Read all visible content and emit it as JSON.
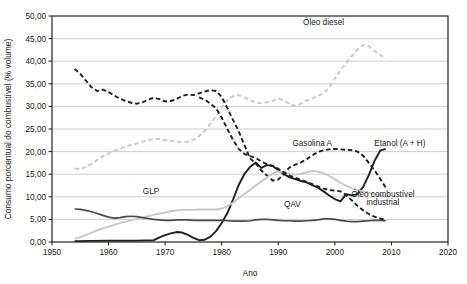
{
  "chart_data": {
    "type": "line",
    "title": "",
    "xlabel": "Ano",
    "ylabel": "Consumo porcentual do  combustível (% volume)",
    "xlim": [
      1950,
      2020
    ],
    "ylim": [
      0,
      50
    ],
    "xticks": [
      "1950",
      "1960",
      "1970",
      "1980",
      "1990",
      "2000",
      "2010",
      "2020"
    ],
    "xtick_values": [
      1950,
      1960,
      1970,
      1980,
      1990,
      2000,
      2010,
      2020
    ],
    "yticks": [
      "0,00",
      "5,00",
      "10,00",
      "15,00",
      "20,00",
      "25,00",
      "30,00",
      "35,00",
      "40,00",
      "45,00",
      "50,00"
    ],
    "ytick_values": [
      0,
      5,
      10,
      15,
      20,
      25,
      30,
      35,
      40,
      45,
      50
    ],
    "grid": true,
    "legend_position": "inline-annotations",
    "annotations": [
      {
        "text": "Óleo diesel",
        "x": 1998,
        "y": 48.0,
        "series": "Óleo diesel"
      },
      {
        "text": "Gasolina A",
        "x": 1996,
        "y": 21.2,
        "series": "Gasolina A"
      },
      {
        "text": "Etanol (A + H)",
        "x": 2011.5,
        "y": 21.2,
        "series": "Etanol (A + H)"
      },
      {
        "text": "GLP",
        "x": 1967.5,
        "y": 10.6,
        "series": "GLP"
      },
      {
        "text": "QAV",
        "x": 1992.5,
        "y": 7.8,
        "series": "QAV"
      },
      {
        "text": "Óleo combustível",
        "x": 2008.5,
        "y": 9.9,
        "series": "Óleo combustível industrial"
      },
      {
        "text": "industrial",
        "x": 2008.5,
        "y": 8.2,
        "series": "Óleo combustível industrial"
      }
    ],
    "series": [
      {
        "name": "Óleo diesel",
        "color": "#c8c8c8",
        "style": "dashed",
        "width": 1.9,
        "x": [
          1954,
          1955,
          1956,
          1957,
          1958,
          1959,
          1960,
          1961,
          1962,
          1963,
          1964,
          1965,
          1966,
          1967,
          1968,
          1969,
          1970,
          1971,
          1972,
          1973,
          1974,
          1975,
          1976,
          1977,
          1978,
          1979,
          1980,
          1981,
          1982,
          1983,
          1984,
          1985,
          1986,
          1987,
          1988,
          1989,
          1990,
          1991,
          1992,
          1993,
          1994,
          1995,
          1996,
          1997,
          1998,
          1999,
          2000,
          2001,
          2002,
          2003,
          2004,
          2005,
          2006,
          2007,
          2008,
          2009
        ],
        "values": [
          16.3,
          16.1,
          16.6,
          17.3,
          18.2,
          19.0,
          19.6,
          20.2,
          20.6,
          21.1,
          21.5,
          21.8,
          22.2,
          22.5,
          22.8,
          22.8,
          22.5,
          22.4,
          22.2,
          22.1,
          22.2,
          22.6,
          23.4,
          24.6,
          26.1,
          27.8,
          29.6,
          31.4,
          32.3,
          32.5,
          32.0,
          31.4,
          30.9,
          30.7,
          30.9,
          31.2,
          31.7,
          31.4,
          30.5,
          30.1,
          30.6,
          31.3,
          31.8,
          32.3,
          32.9,
          34.2,
          36.2,
          38.1,
          39.6,
          41.1,
          42.6,
          43.6,
          43.3,
          42.3,
          41.4,
          40.6
        ]
      },
      {
        "name": "Gasolina A",
        "color": "#1f1f1f",
        "style": "dashed",
        "width": 1.9,
        "x": [
          1954,
          1955,
          1956,
          1957,
          1958,
          1959,
          1960,
          1961,
          1962,
          1963,
          1964,
          1965,
          1966,
          1967,
          1968,
          1969,
          1970,
          1971,
          1972,
          1973,
          1974,
          1975,
          1976,
          1977,
          1978,
          1979,
          1980,
          1981,
          1982,
          1983,
          1984,
          1985,
          1986,
          1987,
          1988,
          1989,
          1990,
          1991,
          1992,
          1993,
          1994,
          1995,
          1996,
          1997,
          1998,
          1999,
          2000,
          2001,
          2002,
          2003,
          2004,
          2005,
          2006,
          2007,
          2008,
          2009
        ],
        "values": [
          38.3,
          37.2,
          35.7,
          34.2,
          33.4,
          33.7,
          33.2,
          32.4,
          31.7,
          31.2,
          30.8,
          30.6,
          30.9,
          31.5,
          31.9,
          31.6,
          31.1,
          31.2,
          31.6,
          32.3,
          32.6,
          32.5,
          32.9,
          33.3,
          33.6,
          33.4,
          32.1,
          29.6,
          27.0,
          24.5,
          21.5,
          18.5,
          17.4,
          15.8,
          14.7,
          13.6,
          13.8,
          15.1,
          16.5,
          17.1,
          17.6,
          18.3,
          19.2,
          19.9,
          20.3,
          20.5,
          20.6,
          20.5,
          20.4,
          20.3,
          20.0,
          19.1,
          17.5,
          15.9,
          14.0,
          12.0
        ]
      },
      {
        "name": "Etanol (A + H)",
        "color": "#1f1f1f",
        "style": "solid",
        "width": 1.9,
        "x": [
          1954,
          1960,
          1965,
          1968,
          1969,
          1970,
          1971,
          1972,
          1973,
          1974,
          1975,
          1976,
          1977,
          1978,
          1979,
          1980,
          1981,
          1982,
          1983,
          1984,
          1985,
          1986,
          1987,
          1988,
          1989,
          1990,
          1991,
          1992,
          1993,
          1994,
          1995,
          1996,
          1997,
          1998,
          1999,
          2000,
          2001,
          2002,
          2003,
          2004,
          2005,
          2006,
          2007,
          2008,
          2009
        ],
        "values": [
          0.2,
          0.3,
          0.3,
          0.4,
          1.0,
          1.5,
          1.9,
          2.2,
          2.1,
          1.6,
          0.9,
          0.4,
          0.5,
          1.2,
          2.4,
          4.2,
          6.4,
          9.4,
          12.6,
          15.0,
          16.6,
          17.6,
          16.4,
          17.0,
          16.8,
          15.9,
          15.0,
          14.3,
          13.9,
          13.5,
          13.2,
          12.6,
          12.0,
          11.2,
          10.3,
          9.5,
          9.0,
          10.6,
          10.3,
          10.6,
          12.2,
          14.8,
          17.9,
          20.2,
          20.6
        ]
      },
      {
        "name": "GLP",
        "color": "#c8c8c8",
        "style": "solid",
        "width": 1.9,
        "x": [
          1954,
          1955,
          1956,
          1957,
          1958,
          1959,
          1960,
          1961,
          1962,
          1963,
          1964,
          1965,
          1966,
          1967,
          1968,
          1969,
          1970,
          1971,
          1972,
          1973,
          1974,
          1975,
          1976,
          1977,
          1978,
          1979,
          1980,
          1981,
          1982,
          1983,
          1984,
          1985,
          1986,
          1987,
          1988,
          1989,
          1990,
          1991,
          1992,
          1993,
          1994,
          1995,
          1996,
          1997,
          1998,
          1999,
          2000,
          2001,
          2002,
          2003,
          2004,
          2005,
          2006,
          2007,
          2008,
          2009
        ],
        "values": [
          0.7,
          1.1,
          1.6,
          2.1,
          2.6,
          3.0,
          3.4,
          3.8,
          4.2,
          4.5,
          4.8,
          5.1,
          5.4,
          5.7,
          6.0,
          6.3,
          6.5,
          6.8,
          7.0,
          7.1,
          7.1,
          7.1,
          7.2,
          7.2,
          7.2,
          7.2,
          7.4,
          7.9,
          8.7,
          9.7,
          10.6,
          11.5,
          12.5,
          13.4,
          14.3,
          15.1,
          15.6,
          15.4,
          15.0,
          14.9,
          15.1,
          15.4,
          15.7,
          15.6,
          15.2,
          14.6,
          13.9,
          13.1,
          12.4,
          11.9,
          11.5,
          11.2,
          10.9,
          10.6,
          10.3,
          10.0
        ]
      },
      {
        "name": "QAV",
        "color": "#4a4a4a",
        "style": "solid",
        "width": 1.7,
        "x": [
          1954,
          1955,
          1956,
          1957,
          1958,
          1959,
          1960,
          1961,
          1962,
          1963,
          1964,
          1965,
          1966,
          1967,
          1968,
          1969,
          1970,
          1971,
          1972,
          1973,
          1974,
          1975,
          1976,
          1977,
          1978,
          1979,
          1980,
          1981,
          1982,
          1983,
          1984,
          1985,
          1986,
          1987,
          1988,
          1989,
          1990,
          1991,
          1992,
          1993,
          1994,
          1995,
          1996,
          1997,
          1998,
          1999,
          2000,
          2001,
          2002,
          2003,
          2004,
          2005,
          2006,
          2007,
          2008,
          2009
        ],
        "values": [
          7.3,
          7.2,
          7.0,
          6.7,
          6.3,
          5.9,
          5.5,
          5.3,
          5.4,
          5.6,
          5.7,
          5.6,
          5.4,
          5.2,
          5.0,
          4.9,
          4.8,
          4.8,
          4.9,
          4.9,
          4.9,
          4.8,
          4.8,
          4.8,
          4.8,
          4.8,
          4.8,
          4.7,
          4.6,
          4.6,
          4.6,
          4.7,
          4.9,
          5.0,
          5.0,
          4.9,
          4.8,
          4.7,
          4.7,
          4.6,
          4.6,
          4.7,
          4.8,
          4.9,
          5.1,
          5.1,
          5.0,
          4.8,
          4.6,
          4.5,
          4.5,
          4.6,
          4.7,
          4.8,
          4.8,
          4.7
        ]
      },
      {
        "name": "Óleo combustível industrial",
        "color": "#1f1f1f",
        "style": "dashed",
        "width": 1.9,
        "x": [
          1976,
          1977,
          1978,
          1979,
          1980,
          1981,
          1982,
          1983,
          1984,
          1985,
          1986,
          1987,
          1988,
          1989,
          1990,
          1991,
          1992,
          1993,
          1994,
          1995,
          1996,
          1997,
          1998,
          1999,
          2000,
          2001,
          2002,
          2003,
          2004,
          2005,
          2006,
          2007,
          2008,
          2009
        ],
        "values": [
          32.0,
          31.5,
          30.6,
          29.6,
          27.5,
          25.0,
          22.6,
          20.6,
          19.5,
          19.0,
          18.6,
          17.8,
          17.2,
          16.9,
          16.2,
          15.4,
          14.7,
          14.2,
          13.8,
          13.3,
          12.8,
          12.3,
          11.8,
          11.5,
          11.4,
          11.2,
          10.4,
          9.2,
          8.0,
          7.0,
          6.2,
          5.6,
          5.2,
          4.9
        ]
      }
    ]
  },
  "plot": {
    "left_px": 52,
    "right_px": 448,
    "top_px": 16,
    "bottom_px": 242
  }
}
